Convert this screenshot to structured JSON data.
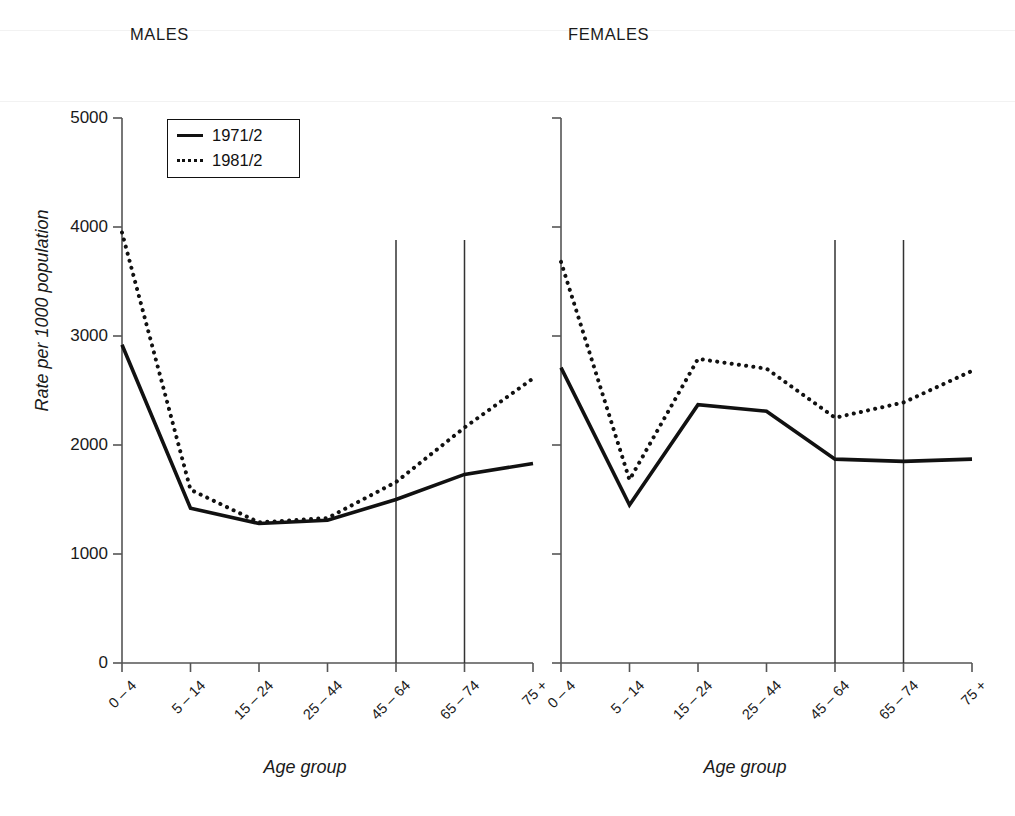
{
  "figure": {
    "panels": [
      {
        "id": "males",
        "title": "MALES"
      },
      {
        "id": "females",
        "title": "FEMALES"
      }
    ],
    "axis": {
      "ylabel": "Rate per 1000 population",
      "xlabel": "Age group",
      "yticks": [
        "0",
        "1000",
        "2000",
        "3000",
        "4000",
        "5000"
      ],
      "xticks": [
        "0 – 4",
        "5 – 14",
        "15 – 24",
        "25 – 44",
        "45 – 64",
        "65 – 74",
        "75 +"
      ]
    },
    "legend": {
      "entries": [
        {
          "label": "1971/2",
          "style": "solid"
        },
        {
          "label": "1981/2",
          "style": "dotted"
        }
      ]
    },
    "colors": {
      "line": "#111111",
      "axis": "#555555",
      "background": "#ffffff"
    }
  },
  "chart_data": [
    {
      "type": "line",
      "title": "MALES",
      "xlabel": "Age group",
      "ylabel": "Rate per 1000 population",
      "categories": [
        "0 – 4",
        "5 – 14",
        "15 – 24",
        "25 – 44",
        "45 – 64",
        "65 – 74",
        "75 +"
      ],
      "ylim": [
        0,
        5000
      ],
      "yticks": [
        0,
        1000,
        2000,
        3000,
        4000,
        5000
      ],
      "grid": false,
      "legend_position": "top-left",
      "vertical_reference_lines": [
        "45 – 64",
        "65 – 74"
      ],
      "series": [
        {
          "name": "1971/2",
          "style": "solid",
          "values": [
            2920,
            1420,
            1280,
            1310,
            1500,
            1730,
            1830
          ]
        },
        {
          "name": "1981/2",
          "style": "dotted",
          "values": [
            3950,
            1590,
            1290,
            1330,
            1660,
            2160,
            2610
          ]
        }
      ]
    },
    {
      "type": "line",
      "title": "FEMALES",
      "xlabel": "Age group",
      "ylabel": "Rate per 1000 population",
      "categories": [
        "0 – 4",
        "5 – 14",
        "15 – 24",
        "25 – 44",
        "45 – 64",
        "65 – 74",
        "75 +"
      ],
      "ylim": [
        0,
        5000
      ],
      "yticks": [
        0,
        1000,
        2000,
        3000,
        4000,
        5000
      ],
      "grid": false,
      "legend_position": "none",
      "vertical_reference_lines": [
        "45 – 64",
        "65 – 74"
      ],
      "series": [
        {
          "name": "1971/2",
          "style": "solid",
          "values": [
            2710,
            1450,
            2370,
            2310,
            1870,
            1850,
            1870
          ]
        },
        {
          "name": "1981/2",
          "style": "dotted",
          "values": [
            3680,
            1680,
            2790,
            2700,
            2250,
            2390,
            2680
          ]
        }
      ]
    }
  ]
}
